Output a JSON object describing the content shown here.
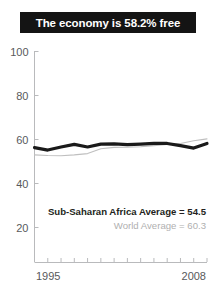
{
  "title": "The economy is 58.2% free",
  "chart_data": {
    "type": "line",
    "title": "The economy is 58.2% free",
    "xlabel": "",
    "ylabel": "",
    "xlim": [
      1995,
      2008
    ],
    "ylim": [
      0,
      100
    ],
    "yticks": [
      100,
      80,
      60,
      40,
      20
    ],
    "xticks": [
      1995,
      1996,
      1997,
      1998,
      1999,
      2000,
      2001,
      2002,
      2003,
      2004,
      2005,
      2006,
      2007,
      2008
    ],
    "xtick_labels_shown": [
      "1995",
      "2008"
    ],
    "grid": false,
    "legend_position": "none",
    "x": [
      1995,
      1996,
      1997,
      1998,
      1999,
      2000,
      2001,
      2002,
      2003,
      2004,
      2005,
      2006,
      2007,
      2008
    ],
    "series": [
      {
        "name": "Sub-Saharan Africa",
        "color": "#1a1a1a",
        "linewidth": 3.2,
        "values": [
          56.3,
          55.2,
          56.6,
          57.8,
          56.6,
          57.9,
          58.0,
          57.7,
          57.9,
          58.2,
          58.2,
          57.2,
          56.1,
          58.2
        ]
      },
      {
        "name": "World",
        "color": "#bfbfbf",
        "linewidth": 1.1,
        "values": [
          53.0,
          52.7,
          52.6,
          53.0,
          53.6,
          55.8,
          56.4,
          56.5,
          56.7,
          57.2,
          57.8,
          58.2,
          59.4,
          60.3
        ]
      }
    ],
    "annotations": [
      {
        "name": "sub-saharan-africa-average",
        "text": "Sub-Saharan Africa Average = 54.5",
        "value": 54.5,
        "color": "#231f20"
      },
      {
        "name": "world-average",
        "text": "World Average = 60.3",
        "value": 60.3,
        "color": "#b0b0b0"
      }
    ]
  },
  "axis": {
    "y_labels": [
      "100",
      "80",
      "60",
      "40",
      "20"
    ],
    "x_start_label": "1995",
    "x_end_label": "2008"
  },
  "annotations": {
    "region_average": "Sub-Saharan Africa Average = 54.5",
    "world_average": "World Average = 60.3"
  },
  "colors": {
    "banner_bg": "#141414",
    "banner_text": "#ffffff",
    "region_line": "#1a1a1a",
    "world_line": "#bfbfbf",
    "axis": "#b9babc"
  }
}
